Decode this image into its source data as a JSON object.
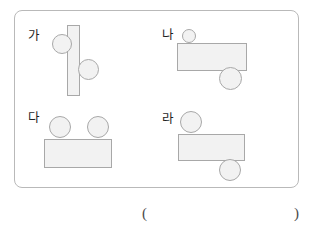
{
  "figure": {
    "name": "four-labeled-shape-groups",
    "frame": {
      "border_color": "#b9b9b9",
      "corner_radius_px": 8
    },
    "style": {
      "shape_fill": "#f2f2f2",
      "shape_stroke": "#a8a8a8",
      "label_color": "#1f1f1f"
    },
    "groups": [
      {
        "key": "ga",
        "label": "가",
        "label_pos": {
          "x": 27,
          "y": 29
        },
        "shapes": [
          {
            "name": "rectangle-vertical",
            "type": "rect",
            "x": 66,
            "y": 24,
            "w": 13,
            "h": 71
          },
          {
            "name": "circle-upper-left",
            "type": "circle",
            "x": 51,
            "y": 33,
            "w": 20,
            "h": 20
          },
          {
            "name": "circle-lower-right",
            "type": "circle",
            "x": 77,
            "y": 58,
            "w": 21,
            "h": 21
          }
        ]
      },
      {
        "key": "na",
        "label": "나",
        "label_pos": {
          "x": 161,
          "y": 28
        },
        "shapes": [
          {
            "name": "rectangle-horizontal",
            "type": "rect",
            "x": 176,
            "y": 42,
            "w": 70,
            "h": 28
          },
          {
            "name": "circle-top-small",
            "type": "circle",
            "x": 181,
            "y": 28,
            "w": 14,
            "h": 14
          },
          {
            "name": "circle-bottom-large",
            "type": "circle",
            "x": 218,
            "y": 66,
            "w": 23,
            "h": 23
          }
        ]
      },
      {
        "key": "da",
        "label": "다",
        "label_pos": {
          "x": 27,
          "y": 111
        },
        "shapes": [
          {
            "name": "rectangle-horizontal",
            "type": "rect",
            "x": 43,
            "y": 138,
            "w": 68,
            "h": 29
          },
          {
            "name": "circle-top-left",
            "type": "circle",
            "x": 48,
            "y": 115,
            "w": 22,
            "h": 22
          },
          {
            "name": "circle-top-right",
            "type": "circle",
            "x": 86,
            "y": 115,
            "w": 22,
            "h": 22
          }
        ]
      },
      {
        "key": "ra",
        "label": "라",
        "label_pos": {
          "x": 161,
          "y": 112
        },
        "shapes": [
          {
            "name": "rectangle-horizontal",
            "type": "rect",
            "x": 177,
            "y": 133,
            "w": 67,
            "h": 27
          },
          {
            "name": "circle-top-left",
            "type": "circle",
            "x": 179,
            "y": 110,
            "w": 22,
            "h": 22
          },
          {
            "name": "circle-bottom-right",
            "type": "circle",
            "x": 218,
            "y": 158,
            "w": 22,
            "h": 22
          }
        ]
      }
    ]
  },
  "answer_blank": {
    "open_paren": "(",
    "close_paren": ")"
  }
}
